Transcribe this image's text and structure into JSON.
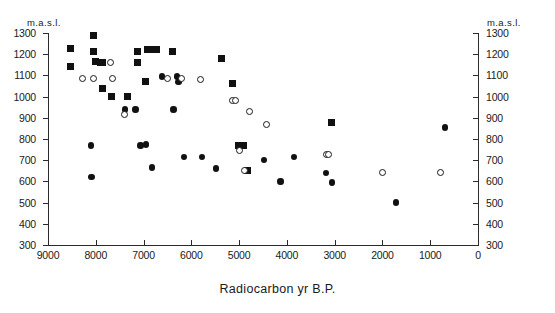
{
  "chart_data": {
    "type": "scatter",
    "title": "",
    "xlabel": "Radiocarbon yr B.P.",
    "ylabel": "m.a.s.l.",
    "y_unit_label": "m.a.s.l.",
    "xlim": [
      9000,
      0
    ],
    "ylim": [
      300,
      1300
    ],
    "x_reversed": true,
    "grid": false,
    "legend_position": "none",
    "xticks": [
      9000,
      8000,
      7000,
      6000,
      5000,
      4000,
      3000,
      2000,
      1000,
      0
    ],
    "xticklabels": [
      "9000",
      "8000",
      "7000",
      "6000",
      "5000",
      "4000",
      "3000",
      "2000",
      "1000",
      "0"
    ],
    "yticks": [
      300,
      400,
      500,
      600,
      700,
      800,
      900,
      1000,
      1100,
      1200,
      1300
    ],
    "yticklabels": [
      "300",
      "400",
      "500",
      "600",
      "700",
      "800",
      "900",
      "1000",
      "1100",
      "1200",
      "1300"
    ],
    "right_axis_ticklabels": [
      "300",
      "400",
      "500",
      "600",
      "700",
      "800",
      "900",
      "1000",
      "1100",
      "1200",
      "1300"
    ],
    "series": [
      {
        "name": "filled-square",
        "marker": "square",
        "fill": "#111111",
        "points": [
          {
            "x": 8520,
            "y": 1225
          },
          {
            "x": 8520,
            "y": 1140
          },
          {
            "x": 8040,
            "y": 1290
          },
          {
            "x": 8040,
            "y": 1215
          },
          {
            "x": 8000,
            "y": 1165
          },
          {
            "x": 7900,
            "y": 1160
          },
          {
            "x": 7860,
            "y": 1160
          },
          {
            "x": 7860,
            "y": 1040
          },
          {
            "x": 7670,
            "y": 1000
          },
          {
            "x": 7330,
            "y": 1000
          },
          {
            "x": 6920,
            "y": 1220
          },
          {
            "x": 6880,
            "y": 1220
          },
          {
            "x": 6730,
            "y": 1220
          },
          {
            "x": 6960,
            "y": 1070
          },
          {
            "x": 7130,
            "y": 1215
          },
          {
            "x": 7130,
            "y": 1160
          },
          {
            "x": 6400,
            "y": 1215
          },
          {
            "x": 5360,
            "y": 1180
          },
          {
            "x": 5130,
            "y": 1060
          },
          {
            "x": 5020,
            "y": 770
          },
          {
            "x": 4900,
            "y": 770
          },
          {
            "x": 4820,
            "y": 650
          },
          {
            "x": 3060,
            "y": 880
          }
        ]
      },
      {
        "name": "filled-circle",
        "marker": "circle-filled",
        "fill": "#111111",
        "points": [
          {
            "x": 8100,
            "y": 770
          },
          {
            "x": 8090,
            "y": 620
          },
          {
            "x": 7390,
            "y": 940
          },
          {
            "x": 7170,
            "y": 940
          },
          {
            "x": 7060,
            "y": 770
          },
          {
            "x": 6820,
            "y": 665
          },
          {
            "x": 6950,
            "y": 775
          },
          {
            "x": 6610,
            "y": 1095
          },
          {
            "x": 6370,
            "y": 940
          },
          {
            "x": 6300,
            "y": 1095
          },
          {
            "x": 6270,
            "y": 1070
          },
          {
            "x": 6150,
            "y": 715
          },
          {
            "x": 5780,
            "y": 715
          },
          {
            "x": 5480,
            "y": 660
          },
          {
            "x": 4480,
            "y": 700
          },
          {
            "x": 4130,
            "y": 600
          },
          {
            "x": 3850,
            "y": 715
          },
          {
            "x": 3180,
            "y": 640
          },
          {
            "x": 3060,
            "y": 595
          },
          {
            "x": 1720,
            "y": 500
          },
          {
            "x": 690,
            "y": 855
          }
        ]
      },
      {
        "name": "open-circle",
        "marker": "circle-open",
        "fill": "#ffffff",
        "points": [
          {
            "x": 8280,
            "y": 1085
          },
          {
            "x": 8040,
            "y": 1085
          },
          {
            "x": 7700,
            "y": 1160
          },
          {
            "x": 7640,
            "y": 1085
          },
          {
            "x": 7390,
            "y": 915
          },
          {
            "x": 6490,
            "y": 1085
          },
          {
            "x": 6200,
            "y": 1085
          },
          {
            "x": 5800,
            "y": 1080
          },
          {
            "x": 5130,
            "y": 980
          },
          {
            "x": 5080,
            "y": 980
          },
          {
            "x": 5000,
            "y": 745
          },
          {
            "x": 4890,
            "y": 650
          },
          {
            "x": 4780,
            "y": 930
          },
          {
            "x": 4430,
            "y": 870
          },
          {
            "x": 3170,
            "y": 725
          },
          {
            "x": 3120,
            "y": 725
          },
          {
            "x": 2000,
            "y": 640
          },
          {
            "x": 790,
            "y": 640
          }
        ]
      }
    ]
  },
  "axes": {
    "unit_left": "m.a.s.l.",
    "unit_right": "m.a.s.l.",
    "x_title": "Radiocarbon yr B.P."
  }
}
